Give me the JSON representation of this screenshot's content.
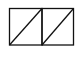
{
  "diagram": {
    "shape": "two-squares-with-diagonals",
    "stroke_color": "#111111",
    "background": "#ffffff",
    "cells": [
      {
        "x": 9.5,
        "y": 8.5,
        "w": 32.5,
        "h": 36.5,
        "diagonal": "bottom-left-to-top-right"
      },
      {
        "x": 42,
        "y": 8.5,
        "w": 31.5,
        "h": 36.5,
        "diagonal": "bottom-left-to-top-right"
      }
    ]
  }
}
